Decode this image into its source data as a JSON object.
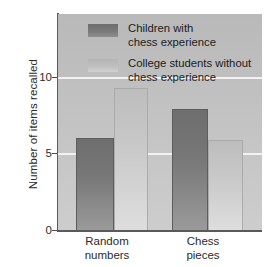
{
  "chart_data": {
    "type": "bar",
    "title": "",
    "xlabel": "",
    "ylabel": "Number of items recalled",
    "categories": [
      "Random\nnumbers",
      "Chess\npieces"
    ],
    "series": [
      {
        "name": "Children with\nchess experience",
        "values": [
          6.0,
          7.9
        ],
        "color": "#777777"
      },
      {
        "name": "College students without\nchess experience",
        "values": [
          9.3,
          5.9
        ],
        "color": "#c8c8c8"
      }
    ],
    "ylim": [
      0,
      14.1
    ],
    "yticks": [
      0,
      5,
      10
    ],
    "ytick_labels": [
      "0",
      "5",
      "10"
    ],
    "grid": true,
    "gridline_values": [
      5,
      10
    ],
    "gridline_color": "#f2f2f2",
    "legend_position": "top-left-inside",
    "panel_background": "#c2c2c2",
    "axis_color": "#5a5a5a"
  },
  "axis": {
    "ylabel": "Number of items recalled",
    "ytick_0": "0",
    "ytick_5": "5",
    "ytick_10": "10",
    "xtick_0": "Random\nnumbers",
    "xtick_1": "Chess\npieces"
  },
  "legend": {
    "entry_0": "Children with\nchess experience",
    "entry_1": "College students without\nchess experience"
  }
}
